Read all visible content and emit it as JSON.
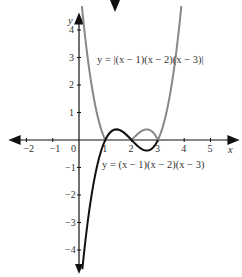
{
  "chart_data": {
    "type": "line",
    "title": "",
    "xlabel": "x",
    "ylabel": "y",
    "xlim": [
      -2.3,
      5.7
    ],
    "ylim": [
      -4.8,
      4.3
    ],
    "grid": false,
    "x_ticks": [
      "-2",
      "-1",
      "0",
      "1",
      "2",
      "3",
      "4",
      "5"
    ],
    "y_ticks": [
      "4",
      "3",
      "2",
      "1",
      "-1",
      "-2",
      "-3",
      "-4"
    ],
    "series": [
      {
        "name": "y = (x − 1)(x − 2)(x − 3)",
        "color": "#111111",
        "function": "(x-1)(x-2)(x-3)",
        "x_range": [
          0.0,
          3.0
        ],
        "key_points": [
          [
            1,
            0
          ],
          [
            1.42,
            0.385
          ],
          [
            2,
            0
          ],
          [
            2.58,
            -0.385
          ],
          [
            3,
            0
          ]
        ]
      },
      {
        "name": "y = |(x − 1)(x − 2)(x − 3)|",
        "color": "#888888",
        "function": "|(x-1)(x-2)(x-3)|",
        "x_range": [
          0.15,
          3.85
        ],
        "key_points": [
          [
            1,
            0
          ],
          [
            1.42,
            0.385
          ],
          [
            2,
            0
          ],
          [
            2.58,
            0.385
          ],
          [
            3,
            0
          ]
        ]
      }
    ],
    "annotations": [
      {
        "text": "y = |(x − 1)(x − 2)(x − 3)|",
        "position": "upper middle"
      },
      {
        "text": "y = (x − 1)(x − 2)(x − 3)",
        "position": "below x-axis"
      }
    ]
  },
  "labels": {
    "x_axis": "x",
    "y_axis": "y",
    "abs_curve": "y = |(x − 1)(x − 2)(x − 3)|",
    "cubic_curve": "y = (x − 1)(x − 2)(x − 3)"
  }
}
